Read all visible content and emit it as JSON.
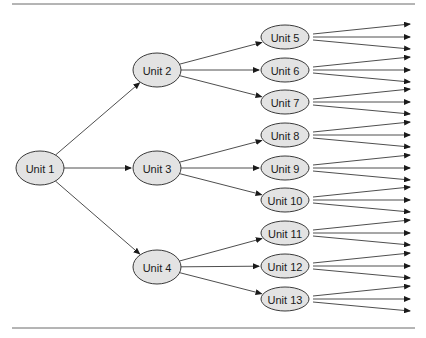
{
  "diagram": {
    "type": "tree",
    "direction": "left-to-right",
    "colors": {
      "node_fill": "#e3e3e3",
      "node_stroke": "#3a3a3a",
      "edge": "#3a3a3a",
      "rule": "#6b6b6b"
    },
    "nodes": [
      {
        "id": "u1",
        "label": "Unit 1",
        "cx": 40,
        "cy": 168,
        "rx": 24,
        "ry": 17
      },
      {
        "id": "u2",
        "label": "Unit 2",
        "cx": 157,
        "cy": 70,
        "rx": 24,
        "ry": 17
      },
      {
        "id": "u3",
        "label": "Unit 3",
        "cx": 157,
        "cy": 168,
        "rx": 24,
        "ry": 17
      },
      {
        "id": "u4",
        "label": "Unit 4",
        "cx": 157,
        "cy": 267,
        "rx": 24,
        "ry": 17
      },
      {
        "id": "u5",
        "label": "Unit 5",
        "cx": 285,
        "cy": 37,
        "rx": 24,
        "ry": 12
      },
      {
        "id": "u6",
        "label": "Unit 6",
        "cx": 285,
        "cy": 70,
        "rx": 24,
        "ry": 12
      },
      {
        "id": "u7",
        "label": "Unit 7",
        "cx": 285,
        "cy": 102,
        "rx": 24,
        "ry": 12
      },
      {
        "id": "u8",
        "label": "Unit 8",
        "cx": 285,
        "cy": 135,
        "rx": 24,
        "ry": 12
      },
      {
        "id": "u9",
        "label": "Unit 9",
        "cx": 285,
        "cy": 168,
        "rx": 24,
        "ry": 12
      },
      {
        "id": "u10",
        "label": "Unit 10",
        "cx": 285,
        "cy": 200,
        "rx": 24,
        "ry": 12
      },
      {
        "id": "u11",
        "label": "Unit 11",
        "cx": 285,
        "cy": 233,
        "rx": 24,
        "ry": 12
      },
      {
        "id": "u12",
        "label": "Unit 12",
        "cx": 285,
        "cy": 266,
        "rx": 24,
        "ry": 12
      },
      {
        "id": "u13",
        "label": "Unit 13",
        "cx": 285,
        "cy": 299,
        "rx": 24,
        "ry": 12
      }
    ],
    "edges": [
      {
        "from": "u1",
        "to": "u2"
      },
      {
        "from": "u1",
        "to": "u3"
      },
      {
        "from": "u1",
        "to": "u4"
      },
      {
        "from": "u2",
        "to": "u5"
      },
      {
        "from": "u2",
        "to": "u6"
      },
      {
        "from": "u2",
        "to": "u7"
      },
      {
        "from": "u3",
        "to": "u8"
      },
      {
        "from": "u3",
        "to": "u9"
      },
      {
        "from": "u3",
        "to": "u10"
      },
      {
        "from": "u4",
        "to": "u11"
      },
      {
        "from": "u4",
        "to": "u12"
      },
      {
        "from": "u4",
        "to": "u13"
      }
    ],
    "leaf_fanout": {
      "arrows_per_leaf": 3,
      "target_x": 410,
      "offsets_y": [
        -13,
        0,
        12
      ]
    }
  }
}
